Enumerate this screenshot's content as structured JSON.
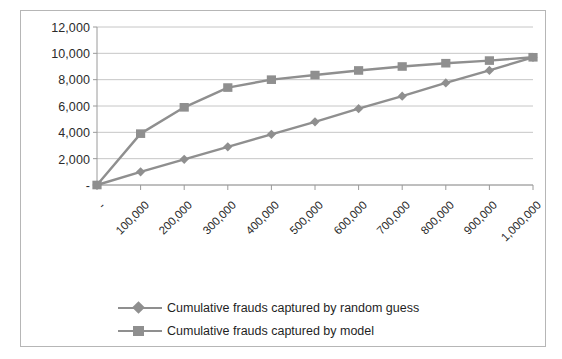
{
  "chart_data": {
    "type": "line",
    "title": "",
    "xlabel": "",
    "ylabel": "",
    "xlim": [
      0,
      1000000
    ],
    "ylim": [
      0,
      12000
    ],
    "grid": true,
    "legend_position": "bottom",
    "y_ticks": [
      "-",
      "2,000",
      "4,000",
      "6,000",
      "8,000",
      "10,000",
      "12,000"
    ],
    "y_tick_values": [
      0,
      2000,
      4000,
      6000,
      8000,
      10000,
      12000
    ],
    "x_ticks": [
      "-",
      "100,000",
      "200,000",
      "300,000",
      "400,000",
      "500,000",
      "600,000",
      "700,000",
      "800,000",
      "900,000",
      "1,000,000"
    ],
    "x_tick_values": [
      0,
      100000,
      200000,
      300000,
      400000,
      500000,
      600000,
      700000,
      800000,
      900000,
      1000000
    ],
    "x": [
      0,
      100000,
      200000,
      300000,
      400000,
      500000,
      600000,
      700000,
      800000,
      900000,
      1000000
    ],
    "series": [
      {
        "name": "Cumulative frauds captured by random guess",
        "marker": "diamond",
        "color": "#8f8f8f",
        "values": [
          0,
          1000,
          1950,
          2900,
          3850,
          4800,
          5800,
          6750,
          7750,
          8700,
          9700
        ]
      },
      {
        "name": "Cumulative frauds captured by model",
        "marker": "square",
        "color": "#8f8f8f",
        "values": [
          0,
          3900,
          5900,
          7400,
          8000,
          8350,
          8700,
          9000,
          9250,
          9450,
          9700
        ]
      }
    ]
  },
  "legend": {
    "items": [
      {
        "label": "Cumulative frauds captured by random guess",
        "marker": "diamond"
      },
      {
        "label": "Cumulative frauds captured by model",
        "marker": "square"
      }
    ]
  },
  "colors": {
    "series": "#8f8f8f",
    "gridline": "#bfbfbf",
    "axis": "#9a9a9a",
    "frame": "#b6b6b6",
    "text": "#2b2b2b"
  }
}
